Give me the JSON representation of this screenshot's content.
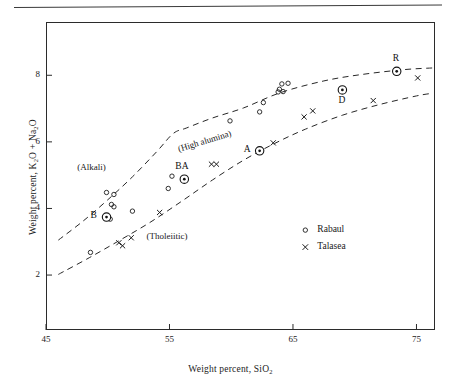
{
  "figure": {
    "background": "#ffffff",
    "line_color": "#2b2b2b",
    "has_top_rule": true
  },
  "chart_data": {
    "type": "scatter",
    "title": "",
    "xlabel": "Weight percent, SiO2",
    "ylabel": "Weight percent, K2O + Na2O",
    "xlabel_parts": {
      "pre": "Weight percent, SiO",
      "sub": "2"
    },
    "ylabel_parts": {
      "pre": "Weight percent, K",
      "sub1": "2",
      "mid": "O + Na",
      "sub2": "2",
      "post": "O"
    },
    "xlim": [
      45,
      76.5
    ],
    "ylim": [
      0.35,
      9.6
    ],
    "xticks": [
      45,
      55,
      65,
      75
    ],
    "xtick_labels": [
      "45",
      "55",
      "65",
      "75"
    ],
    "yticks": [
      2,
      4,
      6,
      8
    ],
    "ytick_labels": [
      "2",
      "4",
      "6",
      "8"
    ],
    "grid": false,
    "legend_position": "lower-right-inside",
    "series": [
      {
        "name": "Rabaul",
        "marker": "open-circle",
        "points": [
          [
            48.6,
            2.68
          ],
          [
            49.8,
            3.74
          ],
          [
            50.2,
            3.68
          ],
          [
            49.9,
            4.48
          ],
          [
            50.5,
            4.42
          ],
          [
            50.3,
            4.12
          ],
          [
            50.5,
            4.05
          ],
          [
            52.0,
            3.92
          ],
          [
            54.9,
            4.6
          ],
          [
            55.2,
            4.97
          ],
          [
            56.2,
            4.88
          ],
          [
            59.9,
            6.63
          ],
          [
            62.3,
            6.9
          ],
          [
            62.6,
            7.18
          ],
          [
            63.9,
            7.58
          ],
          [
            64.1,
            7.74
          ],
          [
            64.2,
            7.51
          ],
          [
            64.6,
            7.76
          ],
          [
            63.8,
            7.5
          ],
          [
            73.4,
            8.12
          ]
        ]
      },
      {
        "name": "Talasea",
        "marker": "cross",
        "points": [
          [
            50.9,
            2.97
          ],
          [
            51.2,
            2.88
          ],
          [
            51.9,
            3.12
          ],
          [
            54.2,
            3.88
          ],
          [
            58.4,
            5.33
          ],
          [
            58.8,
            5.33
          ],
          [
            62.3,
            5.73
          ],
          [
            63.4,
            5.97
          ],
          [
            65.9,
            6.75
          ],
          [
            66.6,
            6.93
          ],
          [
            71.5,
            7.24
          ],
          [
            75.1,
            7.92
          ]
        ]
      }
    ],
    "highlighted_points": [
      {
        "label": "B",
        "x": 49.9,
        "y": 3.74,
        "marker": "circled-dot",
        "label_pos": "left"
      },
      {
        "label": "BA",
        "x": 56.2,
        "y": 4.88,
        "marker": "circled-dot",
        "label_pos": "above"
      },
      {
        "label": "A",
        "x": 62.3,
        "y": 5.73,
        "marker": "circled-dot",
        "label_pos": "left"
      },
      {
        "label": "D",
        "x": 69.0,
        "y": 7.56,
        "marker": "circled-dot",
        "label_pos": "below"
      },
      {
        "label": "R",
        "x": 73.4,
        "y": 8.12,
        "marker": "circled-dot",
        "label_pos": "above"
      }
    ],
    "boundary_curves": [
      {
        "name": "alkali-high-alumina-boundary",
        "style": "dashed",
        "points": [
          [
            46.0,
            3.05
          ],
          [
            48.0,
            3.62
          ],
          [
            50.0,
            4.26
          ],
          [
            52.0,
            4.95
          ],
          [
            54.0,
            5.72
          ],
          [
            55.3,
            6.25
          ],
          [
            56.4,
            6.42
          ],
          [
            58.5,
            6.72
          ],
          [
            61.0,
            7.02
          ],
          [
            64.0,
            7.48
          ],
          [
            67.5,
            7.83
          ],
          [
            70.5,
            8.02
          ],
          [
            74.0,
            8.17
          ],
          [
            76.3,
            8.22
          ]
        ]
      },
      {
        "name": "high-alumina-tholeiitic-boundary",
        "style": "dashed",
        "points": [
          [
            46.0,
            2.02
          ],
          [
            48.5,
            2.52
          ],
          [
            51.0,
            3.05
          ],
          [
            53.5,
            3.6
          ],
          [
            56.0,
            4.22
          ],
          [
            58.5,
            4.86
          ],
          [
            61.0,
            5.45
          ],
          [
            63.5,
            5.95
          ],
          [
            66.0,
            6.38
          ],
          [
            69.0,
            6.8
          ],
          [
            72.0,
            7.12
          ],
          [
            75.0,
            7.38
          ],
          [
            76.3,
            7.46
          ]
        ]
      }
    ],
    "region_labels": [
      {
        "text": "(Alkali)",
        "x": 49.8,
        "y": 5.22,
        "rotation": 0
      },
      {
        "text": "(High alumina)",
        "x": 57.9,
        "y": 6.0,
        "rotation": -17
      },
      {
        "text": "(Tholeiitic)",
        "x": 55.4,
        "y": 3.14,
        "rotation": 0
      }
    ]
  },
  "legend": {
    "entries": [
      {
        "label": "Rabaul",
        "marker": "open-circle"
      },
      {
        "label": "Talasea",
        "marker": "cross"
      }
    ]
  }
}
